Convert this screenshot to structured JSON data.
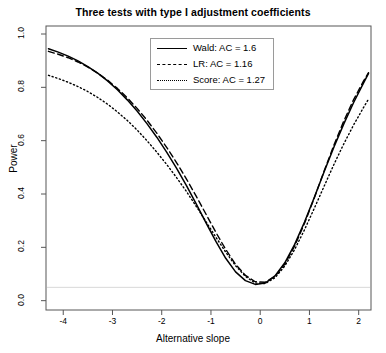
{
  "chart_data": {
    "type": "line",
    "title": "Three tests with type I adjustment coefficients",
    "xlabel": "Alternative slope",
    "ylabel": "Power",
    "xlim": [
      -4.35,
      2.25
    ],
    "ylim": [
      -0.035,
      1.03
    ],
    "xticks": [
      -4,
      -3,
      -2,
      -1,
      0,
      1,
      2
    ],
    "xticklabels": [
      "-4",
      "-3",
      "-2",
      "-1",
      "0",
      "1",
      "2"
    ],
    "yticks": [
      0.0,
      0.2,
      0.4,
      0.6,
      0.8,
      1.0
    ],
    "yticklabels": [
      "0.0",
      "0.2",
      "0.4",
      "0.6",
      "0.8",
      "1.0"
    ],
    "grid": false,
    "legend_position": "top-center",
    "reference_line": {
      "y": 0.05,
      "color": "#d8d8d8",
      "style": "solid"
    },
    "x": [
      -4.3,
      -4.1,
      -3.9,
      -3.7,
      -3.5,
      -3.3,
      -3.1,
      -2.9,
      -2.7,
      -2.5,
      -2.3,
      -2.1,
      -1.9,
      -1.7,
      -1.5,
      -1.3,
      -1.1,
      -0.9,
      -0.7,
      -0.5,
      -0.3,
      -0.1,
      0.1,
      0.3,
      0.5,
      0.7,
      0.9,
      1.1,
      1.3,
      1.5,
      1.7,
      1.9,
      2.1,
      2.2
    ],
    "series": [
      {
        "name": "Wald: AC = 1.6",
        "style": "solid",
        "color": "#000000",
        "ac": 1.6,
        "values": [
          0.945,
          0.932,
          0.917,
          0.899,
          0.878,
          0.853,
          0.824,
          0.791,
          0.753,
          0.711,
          0.664,
          0.613,
          0.557,
          0.497,
          0.432,
          0.363,
          0.292,
          0.222,
          0.159,
          0.108,
          0.075,
          0.061,
          0.066,
          0.093,
          0.142,
          0.211,
          0.295,
          0.388,
          0.484,
          0.577,
          0.664,
          0.744,
          0.817,
          0.852
        ]
      },
      {
        "name": "LR: AC = 1.16",
        "style": "dashed",
        "color": "#000000",
        "ac": 1.16,
        "values": [
          0.935,
          0.924,
          0.911,
          0.895,
          0.876,
          0.853,
          0.827,
          0.796,
          0.761,
          0.721,
          0.677,
          0.628,
          0.575,
          0.518,
          0.457,
          0.392,
          0.324,
          0.256,
          0.192,
          0.136,
          0.095,
          0.071,
          0.069,
          0.091,
          0.137,
          0.205,
          0.29,
          0.386,
          0.487,
          0.585,
          0.675,
          0.755,
          0.824,
          0.855
        ]
      },
      {
        "name": "Score: AC = 1.27",
        "style": "dotted",
        "color": "#000000",
        "ac": 1.27,
        "values": [
          0.845,
          0.833,
          0.819,
          0.803,
          0.784,
          0.762,
          0.737,
          0.708,
          0.676,
          0.64,
          0.6,
          0.557,
          0.511,
          0.462,
          0.41,
          0.354,
          0.296,
          0.238,
          0.182,
          0.131,
          0.091,
          0.066,
          0.064,
          0.086,
          0.13,
          0.192,
          0.266,
          0.347,
          0.43,
          0.512,
          0.589,
          0.66,
          0.725,
          0.756
        ]
      }
    ]
  },
  "legend": {
    "items": [
      {
        "label": "Wald: AC = 1.6",
        "style": "solid"
      },
      {
        "label": "LR: AC = 1.16",
        "style": "dashed"
      },
      {
        "label": "Score: AC = 1.27",
        "style": "dotted"
      }
    ]
  }
}
